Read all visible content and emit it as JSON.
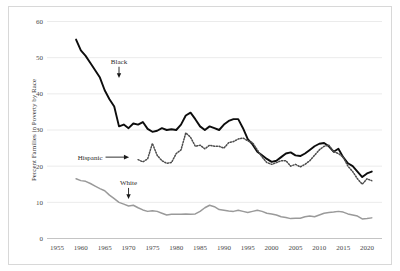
{
  "chart_data": {
    "type": "line",
    "title": "",
    "subtitle": "",
    "xlabel": "",
    "ylabel": "Percent Families in Poverty by Race",
    "xlim": [
      1955,
      2022
    ],
    "ylim": [
      0,
      60
    ],
    "grid": true,
    "legend_position": "inline-annotations",
    "xticks": [
      "1955",
      "1960",
      "1965",
      "1970",
      "1975",
      "1980",
      "1985",
      "1990",
      "1995",
      "2000",
      "2005",
      "2010",
      "2015",
      "2020"
    ],
    "yticks": [
      "0",
      "10",
      "20",
      "30",
      "40",
      "50",
      "60"
    ],
    "annotations": [
      {
        "text": "Black",
        "kind": "down-arrow",
        "x": 1968,
        "y": 45
      },
      {
        "text": "Hispanic",
        "kind": "right-arrow",
        "x": 1970,
        "y": 22.5
      },
      {
        "text": "White",
        "kind": "down-arrow",
        "x": 1970,
        "y": 11.5
      }
    ],
    "series": [
      {
        "name": "Black",
        "color": "#0d0d0d",
        "style": "solid",
        "x": [
          1959,
          1960,
          1961,
          1962,
          1963,
          1964,
          1965,
          1966,
          1967,
          1968,
          1969,
          1970,
          1971,
          1972,
          1973,
          1974,
          1975,
          1976,
          1977,
          1978,
          1979,
          1980,
          1981,
          1982,
          1983,
          1984,
          1985,
          1986,
          1987,
          1988,
          1989,
          1990,
          1991,
          1992,
          1993,
          1994,
          1995,
          1996,
          1997,
          1998,
          1999,
          2000,
          2001,
          2002,
          2003,
          2004,
          2005,
          2006,
          2007,
          2008,
          2009,
          2010,
          2011,
          2012,
          2013,
          2014,
          2015,
          2016,
          2017,
          2018,
          2019,
          2020,
          2021
        ],
        "values": [
          55.0,
          52.0,
          50.5,
          48.5,
          46.5,
          44.5,
          41.0,
          38.5,
          36.5,
          31.0,
          31.5,
          30.5,
          31.8,
          31.5,
          32.2,
          30.3,
          29.5,
          29.8,
          30.5,
          30.0,
          30.2,
          30.0,
          31.5,
          34.0,
          34.8,
          33.0,
          31.0,
          30.0,
          31.0,
          30.5,
          30.0,
          31.5,
          32.5,
          33.0,
          33.0,
          30.5,
          27.5,
          26.0,
          24.0,
          23.0,
          22.0,
          21.2,
          21.5,
          22.5,
          23.5,
          23.8,
          23.0,
          22.8,
          23.5,
          24.5,
          25.5,
          26.2,
          26.4,
          25.5,
          24.0,
          24.8,
          22.5,
          20.8,
          20.0,
          18.5,
          17.0,
          18.0,
          18.5
        ]
      },
      {
        "name": "Hispanic",
        "color": "#4d4d4d",
        "style": "dotted",
        "x": [
          1972,
          1973,
          1974,
          1975,
          1976,
          1977,
          1978,
          1979,
          1980,
          1981,
          1982,
          1983,
          1984,
          1985,
          1986,
          1987,
          1988,
          1989,
          1990,
          1991,
          1992,
          1993,
          1994,
          1995,
          1996,
          1997,
          1998,
          1999,
          2000,
          2001,
          2002,
          2003,
          2004,
          2005,
          2006,
          2007,
          2008,
          2009,
          2010,
          2011,
          2012,
          2013,
          2014,
          2015,
          2016,
          2017,
          2018,
          2019,
          2020,
          2021
        ],
        "values": [
          21.8,
          21.2,
          22.0,
          26.3,
          23.0,
          21.5,
          20.8,
          21.0,
          23.5,
          24.5,
          29.2,
          28.0,
          25.5,
          25.8,
          24.8,
          25.8,
          25.5,
          25.5,
          25.0,
          26.5,
          26.8,
          27.5,
          27.8,
          27.0,
          26.5,
          24.5,
          22.5,
          21.0,
          20.5,
          21.0,
          21.5,
          21.5,
          20.0,
          20.5,
          19.8,
          20.5,
          21.5,
          23.0,
          24.5,
          25.5,
          25.8,
          24.0,
          23.5,
          22.5,
          20.0,
          18.5,
          16.5,
          15.0,
          16.5,
          16.0
        ]
      },
      {
        "name": "White",
        "color": "#9a9a9a",
        "style": "solid",
        "x": [
          1959,
          1960,
          1961,
          1962,
          1963,
          1964,
          1965,
          1966,
          1967,
          1968,
          1969,
          1970,
          1971,
          1972,
          1973,
          1974,
          1975,
          1976,
          1977,
          1978,
          1979,
          1980,
          1981,
          1982,
          1983,
          1984,
          1985,
          1986,
          1987,
          1988,
          1989,
          1990,
          1991,
          1992,
          1993,
          1994,
          1995,
          1996,
          1997,
          1998,
          1999,
          2000,
          2001,
          2002,
          2003,
          2004,
          2005,
          2006,
          2007,
          2008,
          2009,
          2010,
          2011,
          2012,
          2013,
          2014,
          2015,
          2016,
          2017,
          2018,
          2019,
          2020,
          2021
        ],
        "values": [
          16.5,
          16.0,
          15.8,
          15.2,
          14.5,
          13.8,
          13.2,
          12.0,
          11.0,
          10.0,
          9.5,
          9.0,
          9.2,
          8.5,
          7.9,
          7.5,
          7.7,
          7.5,
          7.0,
          6.5,
          6.7,
          6.7,
          6.7,
          6.8,
          6.7,
          6.8,
          7.5,
          8.5,
          9.2,
          8.8,
          8.0,
          7.8,
          7.6,
          7.5,
          7.8,
          7.5,
          7.2,
          7.5,
          7.8,
          7.5,
          7.0,
          6.8,
          6.5,
          6.0,
          5.8,
          5.5,
          5.6,
          5.6,
          6.0,
          6.2,
          6.0,
          6.5,
          7.0,
          7.2,
          7.3,
          7.5,
          7.3,
          6.8,
          6.5,
          6.2,
          5.4,
          5.5,
          5.7
        ]
      }
    ]
  }
}
